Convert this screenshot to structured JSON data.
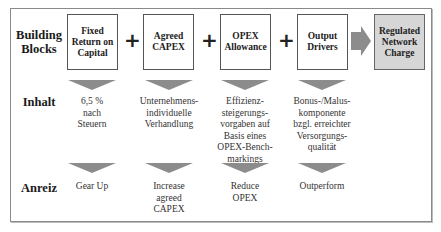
{
  "colors": {
    "frame_border": "#8a8a8a",
    "box_border": "#555555",
    "result_fill": "#d6d6d6",
    "arrow_fill": "#8c8c8c"
  },
  "rows": {
    "building_blocks": "Building Blocks",
    "building_blocks_line1": "Building",
    "building_blocks_line2": "Blocks",
    "inhalt": "Inhalt",
    "anreiz": "Anreiz"
  },
  "blocks": [
    {
      "label": "Fixed Return on Capital",
      "lines": [
        "Fixed",
        "Return on",
        "Capital"
      ],
      "inhalt": [
        "6,5 %",
        "nach",
        "Steuern"
      ],
      "anreiz": [
        "Gear Up"
      ]
    },
    {
      "label": "Agreed CAPEX",
      "lines": [
        "Agreed",
        "CAPEX"
      ],
      "inhalt": [
        "Unternehmens-",
        "individuelle",
        "Verhandlung"
      ],
      "anreiz": [
        "Increase",
        "agreed",
        "CAPEX"
      ]
    },
    {
      "label": "OPEX Allowance",
      "lines": [
        "OPEX",
        "Allowance"
      ],
      "inhalt": [
        "Effizienz-",
        "steigerungs-",
        "vorgaben auf",
        "Basis eines",
        "OPEX-Bench-",
        "markings"
      ],
      "anreiz": [
        "Reduce",
        "OPEX"
      ]
    },
    {
      "label": "Output Drivers",
      "lines": [
        "Output",
        "Drivers"
      ],
      "inhalt": [
        "Bonus-/Malus-",
        "komponente",
        "bzgl. erreichter",
        "Versorgungs-",
        "qualität"
      ],
      "anreiz": [
        "Outperform"
      ]
    }
  ],
  "operators": [
    "+",
    "+",
    "+"
  ],
  "result": {
    "label": "Regulated Network Charge",
    "lines": [
      "Regulated",
      "Network",
      "Charge"
    ]
  }
}
